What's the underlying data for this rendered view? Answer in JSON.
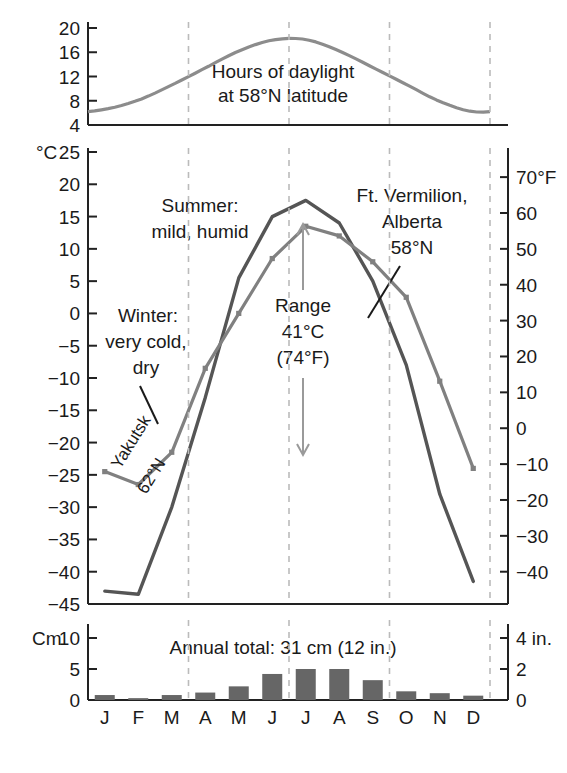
{
  "figure": {
    "title_hidden": "",
    "colors": {
      "yakutsk_line": "#555555",
      "vermilion_line": "#808080",
      "daylight_line": "#8c8c8c",
      "bar_fill": "#666666",
      "gridline": "#bbbbbb",
      "axis": "#222222"
    }
  },
  "months": [
    "J",
    "F",
    "M",
    "A",
    "M",
    "J",
    "J",
    "A",
    "S",
    "O",
    "N",
    "D"
  ],
  "daylight_panel": {
    "ylabel": "",
    "ticks": [
      "20",
      "16",
      "12",
      "8",
      "4"
    ],
    "tick_values": [
      20,
      16,
      12,
      8,
      4
    ],
    "annotation_line1": "Hours of daylight",
    "annotation_line2": "at 58°N latitude"
  },
  "temperature_panel": {
    "left_axis_label": "°C",
    "left_top_tick": "25",
    "left_ticks": [
      "25",
      "20",
      "15",
      "10",
      "5",
      "0",
      "−5",
      "−10",
      "−15",
      "−20",
      "−25",
      "−30",
      "−35",
      "−40",
      "−45"
    ],
    "left_tick_values": [
      25,
      20,
      15,
      10,
      5,
      0,
      -5,
      -10,
      -15,
      -20,
      -25,
      -30,
      -35,
      -40,
      -45
    ],
    "right_axis_label": "70°F",
    "right_ticks": [
      "70°F",
      "60",
      "50",
      "40",
      "30",
      "20",
      "10",
      "0",
      "−10",
      "−20",
      "−30",
      "−40"
    ],
    "right_tick_values": [
      70,
      60,
      50,
      40,
      30,
      20,
      10,
      0,
      -10,
      -20,
      -30,
      -40
    ],
    "annotations": {
      "summer_line1": "Summer:",
      "summer_line2": "mild, humid",
      "winter_line1": "Winter:",
      "winter_line2": "very cold,",
      "winter_line3": "dry",
      "range_line1": "Range",
      "range_line2": "41°C",
      "range_line3": "(74°F)",
      "vermilion_line1": "Ft. Vermilion,",
      "vermilion_line2": "Alberta",
      "vermilion_line3": "58°N",
      "yakutsk_line1": "Yakutsk",
      "yakutsk_line2": "62°N"
    }
  },
  "precip_panel": {
    "left_axis_label": "Cm",
    "left_top_tick": "10",
    "left_ticks": [
      "10",
      "5",
      "0"
    ],
    "left_tick_values": [
      10,
      5,
      0
    ],
    "right_ticks": [
      "4 in.",
      "2",
      "0"
    ],
    "right_tick_values": [
      4,
      2,
      0
    ],
    "annotation": "Annual total: 31 cm (12 in.)"
  },
  "chart_data": [
    {
      "type": "line",
      "title": "Hours of daylight at 58°N latitude",
      "xlabel": "",
      "ylabel": "Hours of daylight",
      "categories": [
        "J",
        "F",
        "M",
        "A",
        "M",
        "J",
        "J",
        "A",
        "S",
        "O",
        "N",
        "D"
      ],
      "ylim": [
        4,
        21
      ],
      "grid": true,
      "series": [
        {
          "name": "Hours of daylight at 58°N latitude",
          "values": [
            6.6,
            8.1,
            10.6,
            13.4,
            16.2,
            18.0,
            18.1,
            16.2,
            13.5,
            10.7,
            7.9,
            6.2
          ]
        }
      ]
    },
    {
      "type": "line",
      "title": "Mean monthly temperature",
      "xlabel": "",
      "ylabel": "°C",
      "categories": [
        "J",
        "F",
        "M",
        "A",
        "M",
        "J",
        "J",
        "A",
        "S",
        "O",
        "N",
        "D"
      ],
      "ylim": [
        -45,
        25
      ],
      "y2label": "°F",
      "y2lim": [
        -49,
        77
      ],
      "grid": true,
      "legend_position": "inline-annotation",
      "series": [
        {
          "name": "Yakutsk 62°N",
          "values": [
            -43.0,
            -43.5,
            -30.0,
            -13.0,
            5.5,
            15.0,
            17.5,
            14.0,
            5.0,
            -8.0,
            -28.0,
            -41.5
          ]
        },
        {
          "name": "Ft. Vermilion, Alberta 58°N",
          "values": [
            -24.5,
            -26.5,
            -21.5,
            -8.5,
            0.0,
            8.5,
            13.5,
            12.0,
            8.0,
            2.5,
            -10.5,
            -24.0
          ]
        }
      ],
      "annotations": [
        {
          "text": "Summer: mild, humid"
        },
        {
          "text": "Winter: very cold, dry"
        },
        {
          "text": "Range 41°C (74°F)"
        }
      ]
    },
    {
      "type": "bar",
      "title": "Monthly precipitation",
      "xlabel": "",
      "ylabel": "Cm",
      "y2label": "in.",
      "categories": [
        "J",
        "F",
        "M",
        "A",
        "M",
        "J",
        "J",
        "A",
        "S",
        "O",
        "N",
        "D"
      ],
      "values": [
        0.8,
        0.3,
        0.8,
        1.2,
        2.2,
        4.2,
        5.0,
        5.0,
        3.2,
        1.4,
        1.1,
        0.7
      ],
      "ylim": [
        0,
        10
      ],
      "y2lim": [
        0,
        4
      ],
      "grid": true,
      "annotation": "Annual total: 31 cm (12 in.)"
    }
  ]
}
